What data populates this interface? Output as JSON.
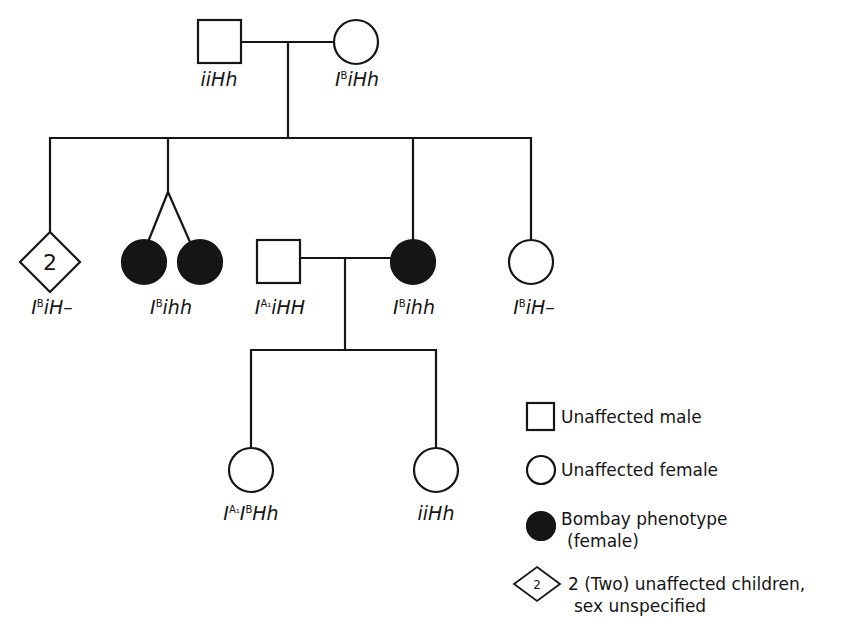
{
  "diagram": {
    "type": "pedigree",
    "colors": {
      "line": "#151515",
      "affected_fill": "#151515",
      "background": "#ffffff"
    },
    "generation_1": {
      "father": {
        "symbol": "square",
        "status": "unaffected",
        "genotype_base": "I",
        "genotype_sup": "",
        "genotype_rest": "iiHh",
        "label": "iiHh"
      },
      "mother": {
        "symbol": "circle",
        "status": "unaffected",
        "label": "IBiHh",
        "base": "I",
        "sup": "B",
        "rest": "iHh"
      }
    },
    "generation_2": [
      {
        "id": "diamond",
        "symbol": "diamond",
        "count_label": "2",
        "status": "unaffected",
        "base": "I",
        "sup": "B",
        "rest": "iH–"
      },
      {
        "id": "twins",
        "symbol": "circle-pair",
        "relation": "twins",
        "status": "affected",
        "base": "I",
        "sup": "B",
        "rest": "ihh"
      },
      {
        "id": "spouse",
        "symbol": "square",
        "status": "unaffected",
        "married_in": true,
        "base": "I",
        "sup": "A₁",
        "rest": "iHH"
      },
      {
        "id": "bombay-female",
        "symbol": "circle",
        "status": "affected",
        "base": "I",
        "sup": "B",
        "rest": "ihh"
      },
      {
        "id": "right-female",
        "symbol": "circle",
        "status": "unaffected",
        "base": "I",
        "sup": "B",
        "rest": "iH–"
      }
    ],
    "generation_3": [
      {
        "id": "child-left",
        "symbol": "circle",
        "status": "unaffected",
        "base": "I",
        "sup": "A₁",
        "base2": "I",
        "sup2": "B",
        "rest": "Hh"
      },
      {
        "id": "child-right",
        "symbol": "circle",
        "status": "unaffected",
        "rest": "iiHh"
      }
    ]
  },
  "legend": {
    "items": [
      {
        "symbol": "square",
        "label": "Unaffected male"
      },
      {
        "symbol": "circle",
        "label": "Unaffected female"
      },
      {
        "symbol": "filled-circle",
        "label": "Bombay phenotype",
        "label2": "(female)"
      },
      {
        "symbol": "diamond",
        "symbol_text": "2",
        "label": "2 (Two) unaffected children,",
        "label2": "sex unspecified"
      }
    ]
  }
}
